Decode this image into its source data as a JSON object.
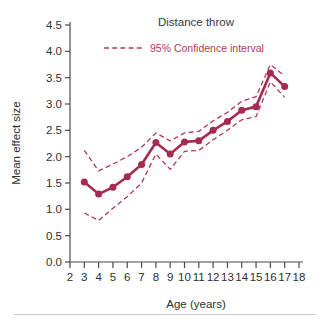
{
  "chart_data": {
    "type": "line",
    "title": "Distance throw",
    "xlabel": "Age (years)",
    "ylabel": "Mean effect size",
    "xlim": [
      2,
      18
    ],
    "ylim": [
      0.0,
      4.5
    ],
    "xticks": [
      2,
      3,
      4,
      5,
      6,
      7,
      8,
      9,
      10,
      11,
      12,
      13,
      14,
      15,
      16,
      17,
      18
    ],
    "yticks": [
      "0.0",
      "0.5",
      "1.0",
      "1.5",
      "2.0",
      "2.5",
      "3.0",
      "3.5",
      "4.0",
      "4.5"
    ],
    "grid": false,
    "legend_position": "top-center",
    "legend": [
      {
        "label": "95% Confidence interval",
        "style": "dashed",
        "color": "#B0395C"
      }
    ],
    "x": [
      3,
      4,
      5,
      6,
      7,
      8,
      9,
      10,
      11,
      12,
      13,
      14,
      15,
      16,
      17
    ],
    "series": [
      {
        "name": "Mean effect size",
        "style": "solid-markers",
        "color": "#A62B4E",
        "values": [
          1.52,
          1.29,
          1.42,
          1.62,
          1.85,
          2.27,
          2.05,
          2.28,
          2.3,
          2.5,
          2.67,
          2.88,
          2.95,
          3.59,
          3.33
        ]
      },
      {
        "name": "Upper 95% confidence interval",
        "style": "dashed",
        "color": "#B0395C",
        "values": [
          2.12,
          1.73,
          1.86,
          2.0,
          2.18,
          2.45,
          2.3,
          2.45,
          2.48,
          2.68,
          2.84,
          3.05,
          3.14,
          3.75,
          3.53
        ]
      },
      {
        "name": "Lower 95% confidence interval",
        "style": "dashed",
        "color": "#B0395C",
        "values": [
          0.93,
          0.79,
          1.02,
          1.24,
          1.5,
          2.05,
          1.76,
          2.1,
          2.12,
          2.32,
          2.5,
          2.7,
          2.76,
          3.42,
          3.13
        ]
      }
    ]
  },
  "colors": {
    "accent": "#A62B4E",
    "ci": "#B0395C",
    "axis": "#4a4a4a",
    "text": "#2f2f2f",
    "rule": "#c9c9c9"
  }
}
